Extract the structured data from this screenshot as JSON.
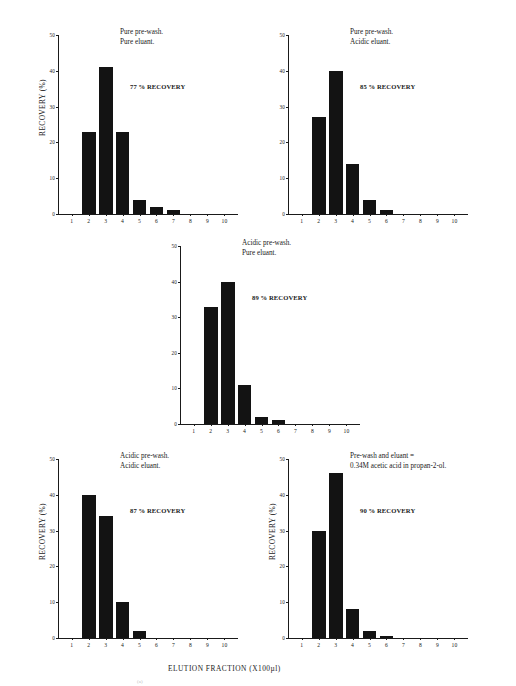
{
  "figure": {
    "global_xlabel": "ELUTION FRACTION (X100µl)",
    "ylabel": "RECOVERY (%)",
    "artifact_mark": "(a)"
  },
  "chart_data": [
    {
      "id": "panel-1",
      "type": "bar",
      "title": "",
      "caption_lines": [
        "Pure pre-wash.",
        "Pure eluant."
      ],
      "annotation": "77 % RECOVERY",
      "recovery_percent": 77,
      "xlabel": "ELUTION FRACTION (X100µl)",
      "ylabel": "RECOVERY (%)",
      "show_ylabel": true,
      "categories": [
        "1",
        "2",
        "3",
        "4",
        "5",
        "6",
        "7",
        "8",
        "9",
        "10"
      ],
      "values": [
        0,
        23,
        41,
        23,
        4,
        2,
        1,
        0,
        0,
        0
      ],
      "ylim": [
        0,
        50
      ],
      "yticks": [
        0,
        10,
        20,
        30,
        40,
        50
      ],
      "grid": false,
      "legend": "none",
      "bar_color": "#131313"
    },
    {
      "id": "panel-2",
      "type": "bar",
      "title": "",
      "caption_lines": [
        "Pure pre-wash.",
        "Acidic eluant."
      ],
      "annotation": "85 % RECOVERY",
      "recovery_percent": 85,
      "xlabel": "ELUTION FRACTION (X100µl)",
      "ylabel": "RECOVERY (%)",
      "show_ylabel": false,
      "categories": [
        "1",
        "2",
        "3",
        "4",
        "5",
        "6",
        "7",
        "8",
        "9",
        "10"
      ],
      "values": [
        0,
        27,
        40,
        14,
        4,
        1,
        0,
        0,
        0,
        0
      ],
      "ylim": [
        0,
        50
      ],
      "yticks": [
        0,
        10,
        20,
        30,
        40,
        50
      ],
      "grid": false,
      "legend": "none",
      "bar_color": "#131313"
    },
    {
      "id": "panel-3",
      "type": "bar",
      "title": "",
      "caption_lines": [
        "Acidic pre-wash.",
        "Pure eluant."
      ],
      "annotation": "89 % RECOVERY",
      "recovery_percent": 89,
      "xlabel": "ELUTION FRACTION (X100µl)",
      "ylabel": "RECOVERY (%)",
      "show_ylabel": false,
      "categories": [
        "1",
        "2",
        "3",
        "4",
        "5",
        "6",
        "7",
        "8",
        "9",
        "10"
      ],
      "values": [
        0,
        33,
        40,
        11,
        2,
        1,
        0,
        0,
        0,
        0
      ],
      "ylim": [
        0,
        50
      ],
      "yticks": [
        0,
        10,
        20,
        30,
        40,
        50
      ],
      "grid": false,
      "legend": "none",
      "bar_color": "#131313"
    },
    {
      "id": "panel-4",
      "type": "bar",
      "title": "",
      "caption_lines": [
        "Acidic pre-wash.",
        "Acidic eluant."
      ],
      "annotation": "87 % RECOVERY",
      "recovery_percent": 87,
      "xlabel": "ELUTION FRACTION (X100µl)",
      "ylabel": "RECOVERY (%)",
      "show_ylabel": true,
      "categories": [
        "1",
        "2",
        "3",
        "4",
        "5",
        "6",
        "7",
        "8",
        "9",
        "10"
      ],
      "values": [
        0,
        40,
        34,
        10,
        2,
        0,
        0,
        0,
        0,
        0
      ],
      "ylim": [
        0,
        50
      ],
      "yticks": [
        0,
        10,
        20,
        30,
        40,
        50
      ],
      "grid": false,
      "legend": "none",
      "bar_color": "#131313"
    },
    {
      "id": "panel-5",
      "type": "bar",
      "title": "",
      "caption_lines": [
        "Pre-wash and eluant =",
        "0.34M acetic acid in propan-2-ol."
      ],
      "annotation": "90 % RECOVERY",
      "recovery_percent": 90,
      "xlabel": "ELUTION FRACTION (X100µl)",
      "ylabel": "RECOVERY (%)",
      "show_ylabel": true,
      "categories": [
        "1",
        "2",
        "3",
        "4",
        "5",
        "6",
        "7",
        "8",
        "9",
        "10"
      ],
      "values": [
        0,
        30,
        46,
        8,
        2,
        0.5,
        0,
        0,
        0,
        0
      ],
      "ylim": [
        0,
        50
      ],
      "yticks": [
        0,
        10,
        20,
        30,
        40,
        50
      ],
      "grid": false,
      "legend": "none",
      "bar_color": "#131313"
    }
  ],
  "layout": {
    "panels": [
      {
        "left": 58,
        "top": 35,
        "width": 180,
        "height": 179,
        "caption_left": 62,
        "caption_top": -8,
        "annotation_left": 72,
        "annotation_top": 48,
        "ylabel_left": -44,
        "ylabel_top": 68
      },
      {
        "left": 288,
        "top": 35,
        "width": 180,
        "height": 179,
        "caption_left": 62,
        "caption_top": -8,
        "annotation_left": 72,
        "annotation_top": 48,
        "ylabel_left": -44,
        "ylabel_top": 68
      },
      {
        "left": 180,
        "top": 246,
        "width": 180,
        "height": 178,
        "caption_left": 62,
        "caption_top": -8,
        "annotation_left": 72,
        "annotation_top": 48,
        "ylabel_left": -44,
        "ylabel_top": 68
      },
      {
        "left": 58,
        "top": 459,
        "width": 180,
        "height": 179,
        "caption_left": 62,
        "caption_top": -8,
        "annotation_left": 72,
        "annotation_top": 48,
        "ylabel_left": -44,
        "ylabel_top": 68
      },
      {
        "left": 288,
        "top": 459,
        "width": 180,
        "height": 179,
        "caption_left": 62,
        "caption_top": -8,
        "annotation_left": 72,
        "annotation_top": 48,
        "ylabel_left": -44,
        "ylabel_top": 68
      }
    ],
    "global_xlabel": {
      "left": 168,
      "top": 664
    },
    "artifact": {
      "left": 137,
      "top": 679
    }
  }
}
